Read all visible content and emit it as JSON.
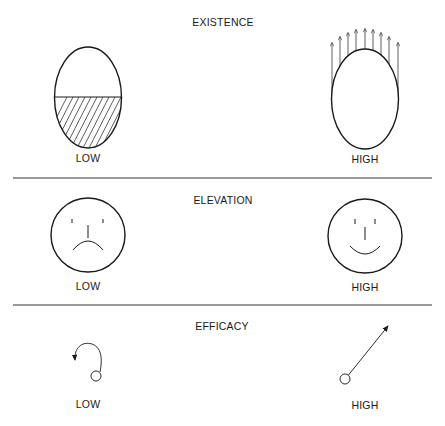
{
  "sections": [
    {
      "title": "EXISTENCE",
      "low": {
        "label": "LOW",
        "icon": "half-filled-egg-icon"
      },
      "high": {
        "label": "HIGH",
        "icon": "egg-with-upward-arrows-icon"
      }
    },
    {
      "title": "ELEVATION",
      "low": {
        "label": "LOW",
        "icon": "sad-face-icon"
      },
      "high": {
        "label": "HIGH",
        "icon": "happy-face-icon"
      }
    },
    {
      "title": "EFFICACY",
      "low": {
        "label": "LOW",
        "icon": "curled-back-arrow-icon"
      },
      "high": {
        "label": "HIGH",
        "icon": "straight-outward-arrow-icon"
      }
    }
  ],
  "colors": {
    "line": "#1a1a1a",
    "background": "#ffffff"
  }
}
